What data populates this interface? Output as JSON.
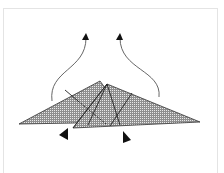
{
  "diagram": {
    "type": "origami-fold-step",
    "colors": {
      "background": "#ffffff",
      "frame": "#e4e4e4",
      "paper_fill": "#9a9a9a",
      "paper_pattern": "#e6e6e6",
      "line": "#222222",
      "arrow": "#555555",
      "arrowhead": "#111111"
    },
    "elements": [
      {
        "name": "left-flap-triangle",
        "shape": "triangle"
      },
      {
        "name": "right-flap-triangle",
        "shape": "triangle"
      },
      {
        "name": "left-fold-arrow",
        "direction": "up"
      },
      {
        "name": "right-fold-arrow",
        "direction": "up"
      },
      {
        "name": "left-push-arrowhead",
        "direction": "left"
      },
      {
        "name": "right-push-arrowhead",
        "direction": "right"
      }
    ]
  }
}
